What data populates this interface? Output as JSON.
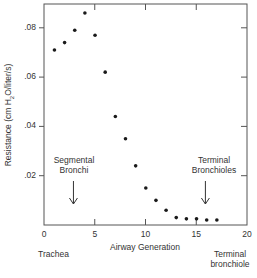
{
  "chart_data": {
    "type": "scatter",
    "title": "",
    "xlabel": "Airway Generation",
    "ylabel": "Resistance (cm H2O/liter/s)",
    "ylabel_parts": {
      "pre": "Resistance (cm H",
      "sub": "2",
      "post": "O/liter/s)"
    },
    "xlim": [
      0,
      20
    ],
    "ylim": [
      0,
      0.09
    ],
    "xticks": [
      0,
      5,
      10,
      15,
      20
    ],
    "xtick_labels": [
      "0",
      "5",
      "10",
      "15",
      "20"
    ],
    "yticks": [
      0.02,
      0.04,
      0.06,
      0.08
    ],
    "ytick_labels": [
      ".02",
      ".04",
      ".06",
      ".08"
    ],
    "grid": false,
    "legend": null,
    "series": [
      {
        "name": "Resistance",
        "x": [
          1,
          2,
          3,
          4,
          5,
          6,
          7,
          8,
          9,
          10,
          11,
          12,
          13,
          14,
          15,
          16,
          17
        ],
        "y": [
          0.071,
          0.074,
          0.079,
          0.086,
          0.077,
          0.062,
          0.044,
          0.035,
          0.024,
          0.015,
          0.01,
          0.006,
          0.003,
          0.0025,
          0.0025,
          0.002,
          0.002
        ]
      }
    ],
    "annotations": [
      {
        "text": "Segmental Bronchi",
        "lines": [
          "Segmental",
          "Bronchi"
        ],
        "arrow_x": 3,
        "arrow": "down"
      },
      {
        "text": "Terminal Bronchioles",
        "lines": [
          "Terminal",
          "Bronchioles"
        ],
        "arrow_x": 16,
        "arrow": "down"
      }
    ],
    "below_axis_labels": [
      {
        "text": "Trachea",
        "lines": [
          "Trachea"
        ]
      },
      {
        "text": "Terminal bronchiole",
        "lines": [
          "Terminal",
          "bronchiole"
        ]
      }
    ]
  }
}
